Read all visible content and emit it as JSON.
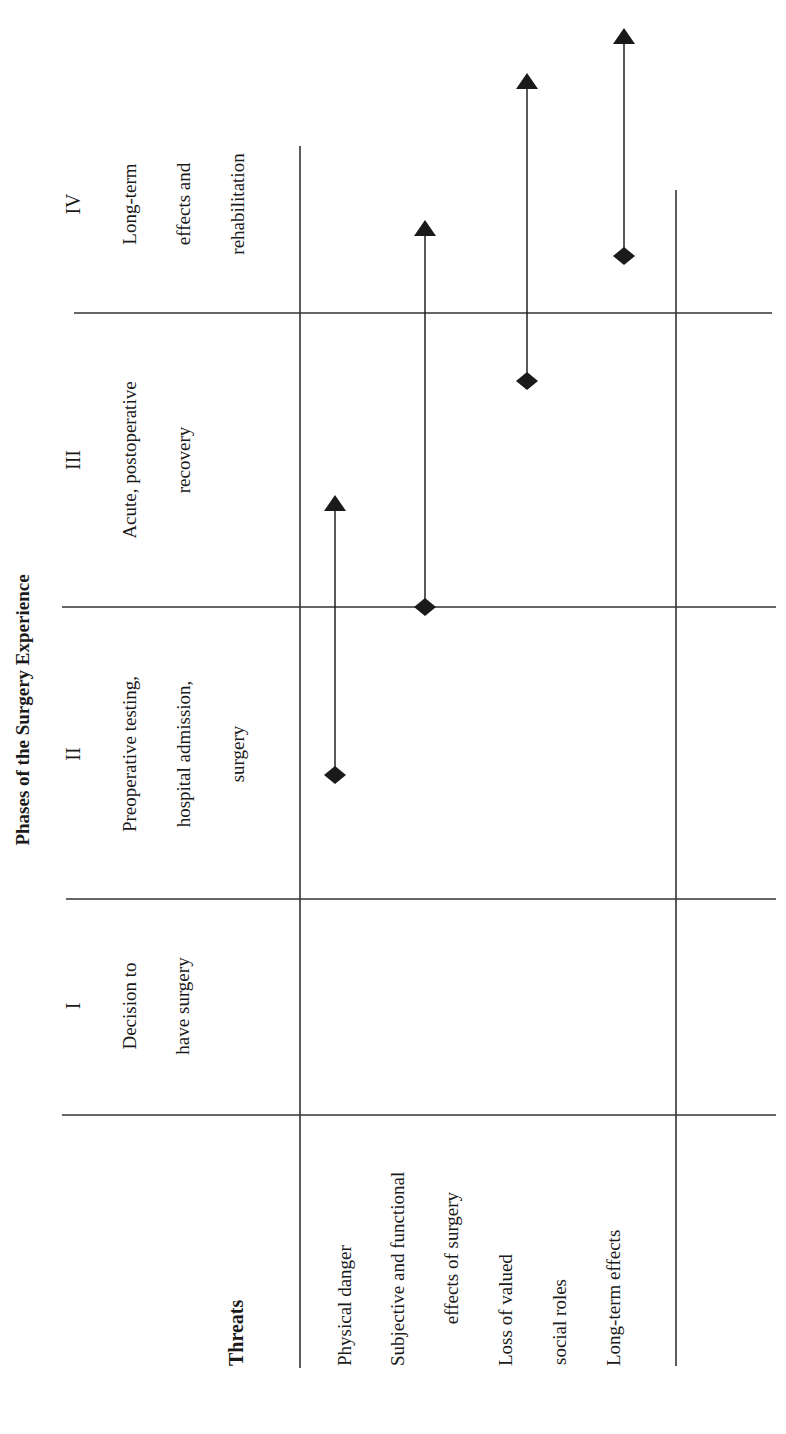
{
  "figure": {
    "title": "Phases of the Surgery Experience",
    "orientation": "rotated-90-ccw",
    "threats_header": "Threats",
    "phases": [
      {
        "numeral": "I",
        "lines": [
          "Decision to",
          "have surgery"
        ]
      },
      {
        "numeral": "II",
        "lines": [
          "Preoperative testing,",
          "hospital admission,",
          "surgery"
        ]
      },
      {
        "numeral": "III",
        "lines": [
          "Acute, postoperative",
          "recovery"
        ]
      },
      {
        "numeral": "IV",
        "lines": [
          "Long-term",
          "effects and",
          "rehabilitation"
        ]
      }
    ],
    "threats": [
      {
        "lines": [
          "Physical danger"
        ],
        "start_marker": "diamond",
        "end_marker": "arrow",
        "spans": "Phase II (middle) to Phase III (middle)"
      },
      {
        "lines": [
          "Subjective and functional",
          "effects of surgery"
        ],
        "start_marker": "diamond",
        "end_marker": "arrow",
        "spans": "Boundary II/III to Phase IV"
      },
      {
        "lines": [
          "Loss of valued",
          "social roles"
        ],
        "start_marker": "diamond",
        "end_marker": "arrow",
        "spans": "Phase III to beyond Phase IV"
      },
      {
        "lines": [
          "Long-term effects"
        ],
        "start_marker": "diamond",
        "end_marker": "arrow",
        "spans": "Phase IV to beyond Phase IV"
      }
    ],
    "colors": {
      "ink": "#1a1a1a",
      "rule": "#333333",
      "background": "#ffffff"
    }
  }
}
